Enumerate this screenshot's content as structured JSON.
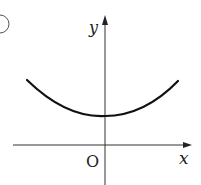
{
  "figure": {
    "label_fragment": ")",
    "axes": {
      "x_label": "x",
      "y_label": "y",
      "origin_label": "O"
    },
    "curve": {
      "description": "U-shaped curve (parabola-like / catenary) opening upward, minimum on the positive y-axis above the origin",
      "stroke": "#111111"
    },
    "colors": {
      "axis": "#333333",
      "curve": "#111111",
      "text": "#222222",
      "background": "#ffffff"
    }
  }
}
